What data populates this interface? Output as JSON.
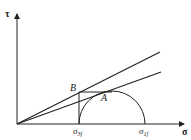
{
  "diagram": {
    "type": "mohr-circle",
    "axes": {
      "y_label": "τ",
      "x_label": "σ"
    },
    "points": {
      "B": "B",
      "A": "A"
    },
    "ticks": {
      "sigma3f_base": "σ",
      "sigma3f_sub": "3f",
      "sigma1f_base": "σ",
      "sigma1f_sub": "1f"
    },
    "lines": [
      {
        "name": "upper-envelope",
        "from": "origin",
        "through": "B"
      },
      {
        "name": "lower-envelope",
        "from": "origin",
        "through": "A"
      }
    ],
    "colors": {
      "stroke": "#222222",
      "background": "#ffffff"
    }
  }
}
